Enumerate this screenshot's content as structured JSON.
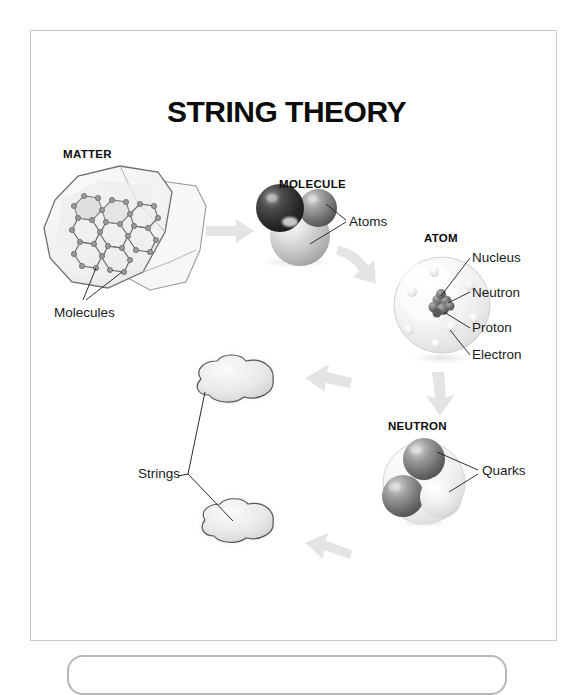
{
  "diagram": {
    "title": "STRING THEORY",
    "type": "scientific-scale-diagram",
    "background_color": "#ffffff",
    "frame_border_color": "#c9c9c9",
    "arrow_color": "#e2e2e2"
  },
  "stages": {
    "matter": {
      "heading": "MATTER",
      "callout": "Molecules",
      "description": "rock fragment with hexagonal molecular lattice"
    },
    "molecule": {
      "heading": "MOLECULE",
      "callout": "Atoms",
      "description": "three shaded spheres bonded together"
    },
    "atom": {
      "heading": "ATOM",
      "callouts": {
        "nucleus": "Nucleus",
        "neutron": "Neutron",
        "proton": "Proton",
        "electron": "Electron"
      },
      "description": "translucent sphere with central nucleus cluster and orbiting electrons"
    },
    "neutron": {
      "heading": "NEUTRON",
      "callout": "Quarks",
      "description": "three spheres inside a translucent shell"
    },
    "strings": {
      "callout": "Strings",
      "description": "two vibrating membrane blobs connected by thin strings"
    }
  },
  "flow_arrows": [
    {
      "name": "matter-to-molecule",
      "direction": "right"
    },
    {
      "name": "molecule-to-atom",
      "direction": "down-right-curve"
    },
    {
      "name": "atom-to-neutron",
      "direction": "down"
    },
    {
      "name": "neutron-to-strings",
      "direction": "left"
    },
    {
      "name": "strings-to-matter",
      "direction": "left-up"
    }
  ]
}
